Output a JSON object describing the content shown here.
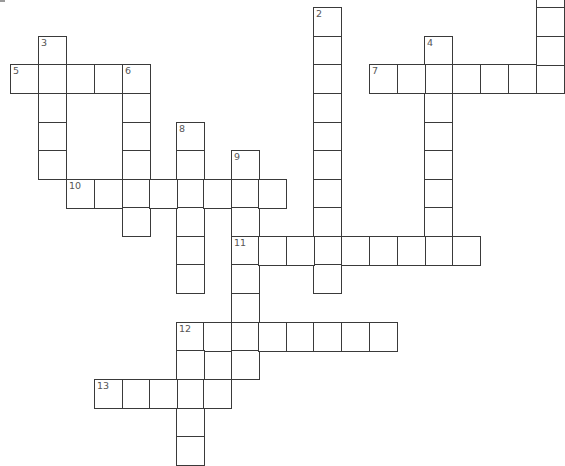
{
  "puzzle": {
    "cell_px": 28,
    "col_x": [
      10,
      38,
      66,
      94,
      122,
      149,
      176,
      203,
      231,
      258,
      286,
      313,
      341,
      369,
      397,
      424,
      452,
      480,
      508,
      536
    ],
    "row_y": [
      -21,
      7,
      36,
      64,
      93,
      122,
      150,
      179,
      207,
      236,
      264,
      293,
      322,
      350,
      379,
      408,
      436
    ],
    "row_offset": 1,
    "black_cells": [
      [
        12,
        7
      ]
    ],
    "numbers": [
      {
        "n": "2",
        "row": 0,
        "col": 11
      },
      {
        "n": "3",
        "row": 1,
        "col": 1
      },
      {
        "n": "4",
        "row": 1,
        "col": 15
      },
      {
        "n": "5",
        "row": 2,
        "col": 0
      },
      {
        "n": "6",
        "row": 2,
        "col": 4
      },
      {
        "n": "7",
        "row": 2,
        "col": 13
      },
      {
        "n": "8",
        "row": 4,
        "col": 6
      },
      {
        "n": "9",
        "row": 5,
        "col": 8
      },
      {
        "n": "10",
        "row": 6,
        "col": 2
      },
      {
        "n": "11",
        "row": 8,
        "col": 8
      },
      {
        "n": "12",
        "row": 11,
        "col": 6
      },
      {
        "n": "13",
        "row": 13,
        "col": 3
      }
    ],
    "entries": [
      {
        "label": "2-down",
        "row": 0,
        "col": 11,
        "dir": "down",
        "len": 10
      },
      {
        "label": "3-down",
        "row": 1,
        "col": 1,
        "dir": "down",
        "len": 5
      },
      {
        "label": "4-down",
        "row": 1,
        "col": 15,
        "dir": "down",
        "len": 8
      },
      {
        "label": "5-across",
        "row": 2,
        "col": 0,
        "dir": "across",
        "len": 5
      },
      {
        "label": "6-down",
        "row": 2,
        "col": 4,
        "dir": "down",
        "len": 6
      },
      {
        "label": "7-across",
        "row": 2,
        "col": 13,
        "dir": "across",
        "len": 7
      },
      {
        "label": "8-down",
        "row": 4,
        "col": 6,
        "dir": "down",
        "len": 6
      },
      {
        "label": "9-down",
        "row": 5,
        "col": 8,
        "dir": "down",
        "len": 8
      },
      {
        "label": "10-across",
        "row": 6,
        "col": 2,
        "dir": "across",
        "len": 8
      },
      {
        "label": "11-across",
        "row": 8,
        "col": 8,
        "dir": "across",
        "len": 9
      },
      {
        "label": "12-across",
        "row": 11,
        "col": 6,
        "dir": "across",
        "len": 8
      },
      {
        "label": "12-down",
        "row": 11,
        "col": 6,
        "dir": "down",
        "len": 5
      },
      {
        "label": "13-across",
        "row": 13,
        "col": 3,
        "dir": "across",
        "len": 5
      },
      {
        "label": "1-down-partial",
        "row": -1,
        "col": 19,
        "dir": "down",
        "len": 4
      },
      {
        "label": "12-extra",
        "row": 12,
        "col": 8,
        "dir": "down",
        "len": 1
      }
    ]
  }
}
